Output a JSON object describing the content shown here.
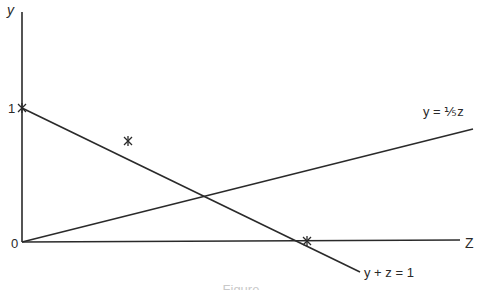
{
  "figure": {
    "axes": {
      "vertical_label": "y",
      "horizontal_label": "Z",
      "origin_label": "0",
      "y_tick_label": "1"
    },
    "lines": [
      {
        "id": "line-y-plus-z",
        "label": "y + z = 1"
      },
      {
        "id": "line-y-fifth-z",
        "label": "y = ⅕z"
      }
    ],
    "markers": [
      "(0,1)",
      "midpoint on y + z = 1",
      "(1,0)"
    ],
    "caption_partial": "Figure"
  },
  "colors": {
    "ink": "#2a2a2a",
    "background": "#ffffff"
  }
}
